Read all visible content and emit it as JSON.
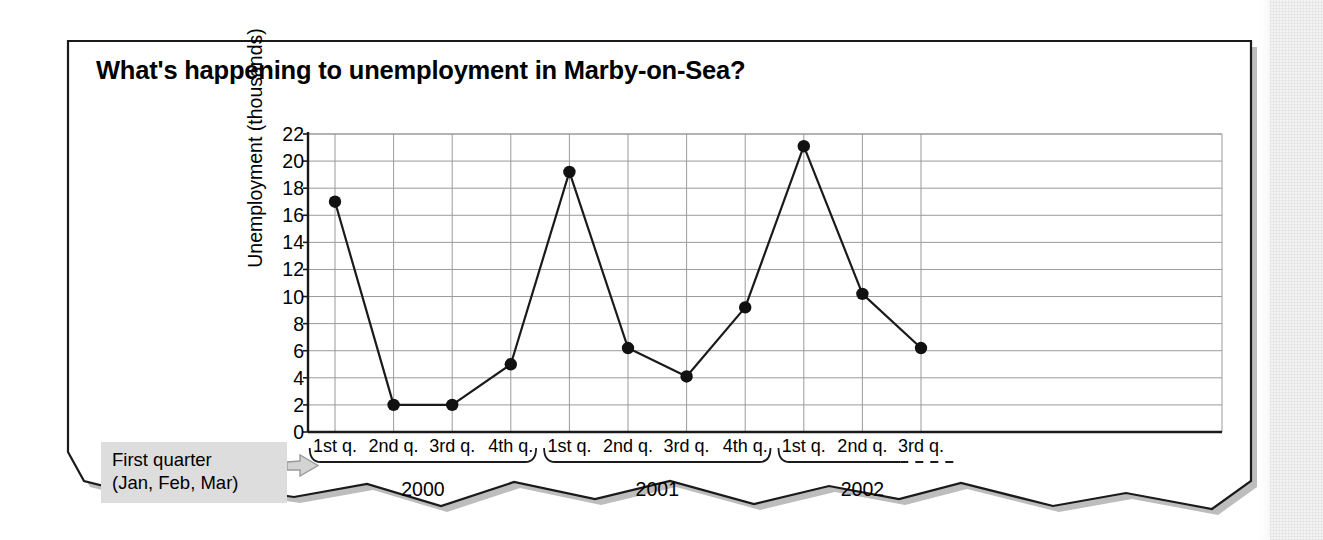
{
  "figure": {
    "title": "What's happening to unemployment in Marby-on-Sea?",
    "callout": {
      "line1": "First quarter",
      "line2": "(Jan, Feb, Mar)",
      "arrow_icon": "arrow-right-icon",
      "background_color": "#dddddd"
    },
    "panel": {
      "background_color": "#ffffff",
      "border_color": "#1a1a1a",
      "shadow_color": "#b5b5b5"
    }
  },
  "chart_data": {
    "type": "line",
    "title": "What's happening to unemployment in Marby-on-Sea?",
    "xlabel": "",
    "ylabel": "Unemployment (thousands)",
    "categories": [
      "1st q.",
      "2nd q.",
      "3rd q.",
      "4th q.",
      "1st q.",
      "2nd q.",
      "3rd q.",
      "4th q.",
      "1st q.",
      "2nd q.",
      "3rd q."
    ],
    "values": [
      17.0,
      2.0,
      2.0,
      5.0,
      19.2,
      6.2,
      4.1,
      9.2,
      21.1,
      10.2,
      6.2
    ],
    "ylim": [
      0,
      22
    ],
    "yticks": [
      0,
      2,
      4,
      6,
      8,
      10,
      12,
      14,
      16,
      18,
      20,
      22
    ],
    "ytick_labels": [
      "0",
      "2",
      "4",
      "6",
      "8",
      "10",
      "12",
      "14",
      "16",
      "18",
      "20",
      "22"
    ],
    "grid": true,
    "legend": "none",
    "marker": "filled-circle",
    "line_color": "#1a1a1a",
    "marker_color": "#111111",
    "grid_color": "#9a9a9a",
    "axis_color": "#1a1a1a",
    "groups": [
      {
        "label": "2000",
        "start_index": 0,
        "end_index": 3,
        "complete": true
      },
      {
        "label": "2001",
        "start_index": 4,
        "end_index": 7,
        "complete": true
      },
      {
        "label": "2002",
        "start_index": 8,
        "end_index": 10,
        "complete": false,
        "bracket_style": "dashed-tail"
      }
    ]
  }
}
